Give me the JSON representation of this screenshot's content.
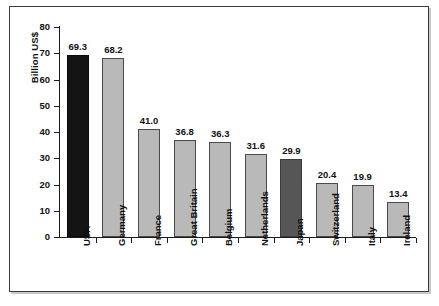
{
  "chart_data": {
    "type": "bar",
    "title": "",
    "subtitle": "",
    "xlabel": "",
    "ylabel": "Billion US$",
    "ylim": [
      0,
      80
    ],
    "yticks": [
      0,
      10,
      20,
      30,
      40,
      50,
      60,
      70,
      80
    ],
    "ytick_labels": [
      "0",
      "10",
      "20",
      "30",
      "40",
      "50",
      "60",
      "70",
      "80"
    ],
    "grid": false,
    "legend": null,
    "categories": [
      "USA",
      "Germany",
      "France",
      "Great Britain",
      "Belgium",
      "Netherlands",
      "Japan",
      "Switzerland",
      "Italy",
      "Ireland"
    ],
    "values": [
      69.3,
      68.2,
      41.0,
      36.8,
      36.3,
      31.6,
      29.9,
      20.4,
      19.9,
      13.4
    ],
    "value_labels": [
      "69.3",
      "68.2",
      "41.0",
      "36.8",
      "36.3",
      "31.6",
      "29.9",
      "20.4",
      "19.9",
      "13.4"
    ],
    "bar_styles": [
      "black",
      "light",
      "light",
      "light",
      "light",
      "light",
      "dark",
      "light",
      "light",
      "light"
    ],
    "colors": {
      "bar_light": "#b9b9b9",
      "bar_dark": "#565656",
      "bar_black": "#141414",
      "outline": "#4a4a4a",
      "axis": "#1b1b1b",
      "text": "#111111",
      "frame": "#3a3a3a",
      "background": "#ffffff"
    }
  }
}
